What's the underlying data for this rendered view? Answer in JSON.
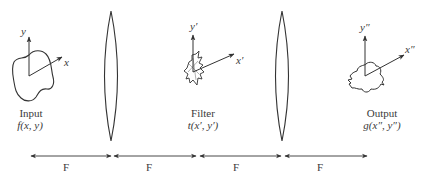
{
  "diagram": {
    "type": "4f-optical-correlator",
    "colors": {
      "line": "#333333",
      "text": "#3a3a3a",
      "background": "#ffffff"
    },
    "planes": {
      "input": {
        "title": "Input",
        "function": "f(x, y)",
        "axis_x": "x",
        "axis_y": "y"
      },
      "filter": {
        "title": "Filter",
        "function": "t(x′, y′)",
        "axis_x": "x′",
        "axis_y": "y′"
      },
      "output": {
        "title": "Output",
        "function": "g(x″, y″)",
        "axis_x": "x″",
        "axis_y": "y″"
      }
    },
    "lenses": [
      {
        "id": "lens-1",
        "center_x": 111
      },
      {
        "id": "lens-2",
        "center_x": 282
      }
    ],
    "distances": [
      {
        "label": "F"
      },
      {
        "label": "F"
      },
      {
        "label": "F"
      },
      {
        "label": "F"
      }
    ]
  }
}
